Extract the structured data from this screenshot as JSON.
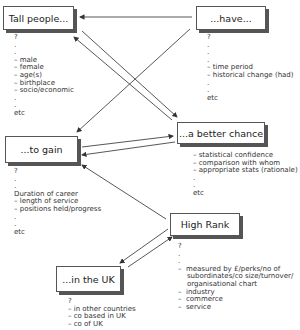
{
  "nodes": {
    "tall_people": {
      "label": "Tall people...",
      "notes": "?\n.\n.\n– male\n– female\n– age(s)\n– birthplace\n– socio/economic\n.\n.\netc"
    },
    "have": {
      "label": "...have...",
      "notes": "?\n.\n.\n.\n– time period\n– historical change (had)\n.\n.\netc"
    },
    "to_gain": {
      "label": "...to gain",
      "notes": "?\n.\n.\nDuration of career\n– length of service\n– positions held/progress\n.\n.\netc"
    },
    "better_chance": {
      "label": "...a better chance",
      "notes": "– statistical confidence\n– comparison with whom\n– appropriate stats (rationale)\n.\n.\netc"
    },
    "high_rank": {
      "label": "High Rank",
      "notes": "?\n.\n.\n–  measured by £/perks/no of\n    subordinates/co size/turnover/\n    organisational chart\n–  industry\n–  commerce\n–  service"
    },
    "in_uk": {
      "label": "...in the UK",
      "notes": "?\n– in other countries\n– co based in UK\n– co of UK"
    }
  },
  "edges": [
    {
      "from": "have",
      "to": "tall_people"
    },
    {
      "from": "tall_people",
      "to": "better_chance"
    },
    {
      "from": "better_chance",
      "to": "tall_people"
    },
    {
      "from": "have",
      "to": "to_gain"
    },
    {
      "from": "to_gain",
      "to": "better_chance"
    },
    {
      "from": "better_chance",
      "to": "to_gain"
    },
    {
      "from": "high_rank",
      "to": "to_gain"
    },
    {
      "from": "high_rank",
      "to": "in_uk"
    },
    {
      "from": "in_uk",
      "to": "high_rank"
    }
  ]
}
